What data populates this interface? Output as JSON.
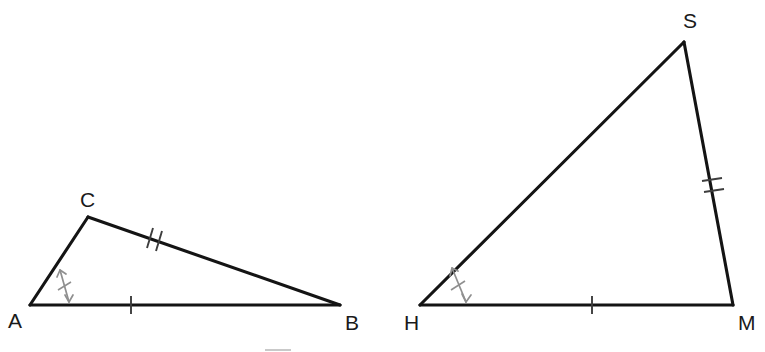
{
  "figure": {
    "background_color": "#ffffff",
    "line_color": "#141414",
    "mark_color": "#8f8f8f",
    "tick_color": "#3d3d3d",
    "width": 765,
    "height": 352
  },
  "triangles": [
    {
      "name": "ABC",
      "vertices": [
        {
          "label": "A",
          "x": 30,
          "y": 305,
          "label_x": 8,
          "label_y": 328
        },
        {
          "label": "B",
          "x": 340,
          "y": 305,
          "label_x": 345,
          "label_y": 330
        },
        {
          "label": "C",
          "x": 88,
          "y": 217,
          "label_x": 80,
          "label_y": 207
        }
      ],
      "sides": [
        {
          "name": "AB",
          "from": "A",
          "to": "B",
          "ticks": 1
        },
        {
          "name": "AC",
          "from": "A",
          "to": "C",
          "ticks": 0
        },
        {
          "name": "CB",
          "from": "C",
          "to": "B",
          "ticks": 2
        }
      ],
      "angle_marks": [
        {
          "at": "A",
          "style": "double-headed-arrow-with-tick"
        }
      ]
    },
    {
      "name": "HSM",
      "vertices": [
        {
          "label": "H",
          "x": 420,
          "y": 305,
          "label_x": 404,
          "label_y": 330
        },
        {
          "label": "M",
          "x": 733,
          "y": 305,
          "label_x": 738,
          "label_y": 330
        },
        {
          "label": "S",
          "x": 684,
          "y": 42,
          "label_x": 683,
          "label_y": 28
        }
      ],
      "sides": [
        {
          "name": "HM",
          "from": "H",
          "to": "M",
          "ticks": 1
        },
        {
          "name": "HS",
          "from": "H",
          "to": "S",
          "ticks": 0
        },
        {
          "name": "SM",
          "from": "S",
          "to": "M",
          "ticks": 2
        }
      ],
      "angle_marks": [
        {
          "at": "H",
          "style": "double-headed-arrow-with-tick"
        }
      ]
    }
  ],
  "artifacts": [
    {
      "name": "stray-line-segment",
      "x1": 265,
      "y1": 350,
      "x2": 291,
      "y2": 350
    }
  ]
}
